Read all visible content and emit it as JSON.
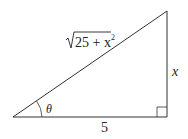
{
  "diagram": {
    "type": "right-triangle",
    "labels": {
      "hypotenuse_radicand": "25 + x",
      "hypotenuse_exponent": "2",
      "opposite": "x",
      "adjacent": "5",
      "angle": "θ"
    },
    "colors": {
      "stroke": "#333333",
      "text": "#222222"
    }
  }
}
